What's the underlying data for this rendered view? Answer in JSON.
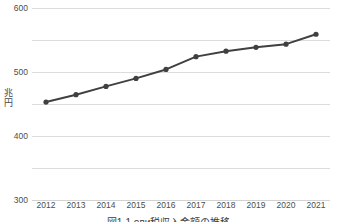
{
  "chart_data": {
    "type": "line",
    "title": "",
    "caption": "図1-1 ови税収入金額の推移",
    "xlabel": "",
    "ylabel": "兆円",
    "ylabel_chars": [
      "兆",
      "円"
    ],
    "categories": [
      "2012",
      "2013",
      "2014",
      "2015",
      "2016",
      "2017",
      "2018",
      "2019",
      "2020",
      "2021"
    ],
    "values": [
      306,
      329,
      355,
      380,
      408,
      448,
      465,
      477,
      487,
      518
    ],
    "series": [
      {
        "name": "",
        "values": [
          306,
          329,
          355,
          380,
          408,
          448,
          465,
          477,
          487,
          518
        ]
      }
    ],
    "ylim": [
      0,
      600
    ],
    "yticks": [
      0,
      100,
      200,
      300,
      400,
      500,
      600
    ],
    "ytick_labels": [
      "0",
      "100",
      "200",
      "300",
      "400",
      "500",
      "600"
    ],
    "grid": true,
    "legend": false,
    "legend_position": "none",
    "line_color": "#404040",
    "marker_color": "#404040",
    "grid_color": "#dcdcdc",
    "text_color": "#4d4d4d",
    "marker": "circle",
    "line_width": 2
  }
}
